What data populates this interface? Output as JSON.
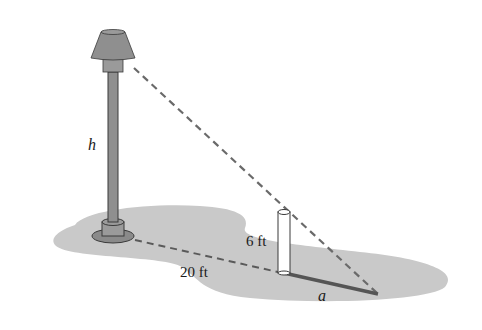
{
  "diagram": {
    "labels": {
      "lamp_height": "h",
      "post_height": "6 ft",
      "distance": "20 ft",
      "shadow_length": "a"
    },
    "colors": {
      "ground": "#c9c9c9",
      "lamp": "#8f8f8f",
      "outline": "#3a3a3a",
      "dashed_line": "#6a6a6a",
      "post": "#ffffff",
      "shadow": "#555555"
    }
  }
}
